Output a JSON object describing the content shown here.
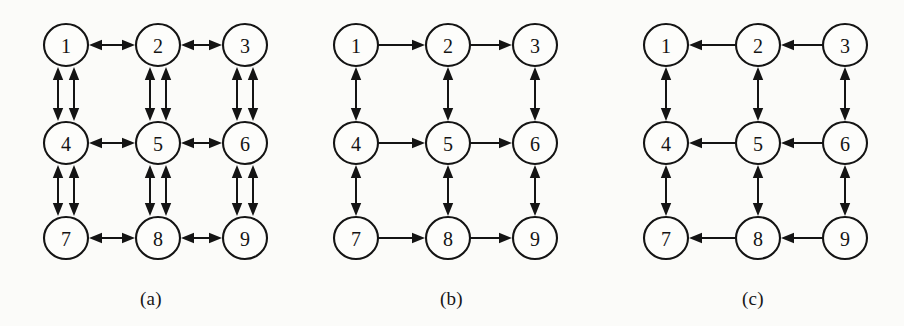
{
  "figure": {
    "background_color": "#fbfbf9",
    "ink_color": "#141414",
    "width": 904,
    "height": 326
  },
  "panels": [
    {
      "id": "a",
      "caption": "(a)",
      "caption_x": 140,
      "caption_y": 288,
      "origin_x": 0,
      "nodes": [
        {
          "id": "n1",
          "label": "1",
          "col": 0,
          "row": 0
        },
        {
          "id": "n2",
          "label": "2",
          "col": 1,
          "row": 0
        },
        {
          "id": "n3",
          "label": "3",
          "col": 2,
          "row": 0
        },
        {
          "id": "n4",
          "label": "4",
          "col": 0,
          "row": 1
        },
        {
          "id": "n5",
          "label": "5",
          "col": 1,
          "row": 1
        },
        {
          "id": "n6",
          "label": "6",
          "col": 2,
          "row": 1
        },
        {
          "id": "n7",
          "label": "7",
          "col": 0,
          "row": 2
        },
        {
          "id": "n8",
          "label": "8",
          "col": 1,
          "row": 2
        },
        {
          "id": "n9",
          "label": "9",
          "col": 2,
          "row": 2
        }
      ],
      "horizontal_edge_style": "bidirectional-single",
      "vertical_edge_style": "bidirectional-double",
      "edges": [
        {
          "from": "1",
          "to": "2",
          "orientation": "horizontal",
          "arrows": "both",
          "lines": 1
        },
        {
          "from": "2",
          "to": "3",
          "orientation": "horizontal",
          "arrows": "both",
          "lines": 1
        },
        {
          "from": "4",
          "to": "5",
          "orientation": "horizontal",
          "arrows": "both",
          "lines": 1
        },
        {
          "from": "5",
          "to": "6",
          "orientation": "horizontal",
          "arrows": "both",
          "lines": 1
        },
        {
          "from": "7",
          "to": "8",
          "orientation": "horizontal",
          "arrows": "both",
          "lines": 1
        },
        {
          "from": "8",
          "to": "9",
          "orientation": "horizontal",
          "arrows": "both",
          "lines": 1
        },
        {
          "from": "1",
          "to": "4",
          "orientation": "vertical",
          "arrows": "both",
          "lines": 2
        },
        {
          "from": "2",
          "to": "5",
          "orientation": "vertical",
          "arrows": "both",
          "lines": 2
        },
        {
          "from": "3",
          "to": "6",
          "orientation": "vertical",
          "arrows": "both",
          "lines": 2
        },
        {
          "from": "4",
          "to": "7",
          "orientation": "vertical",
          "arrows": "both",
          "lines": 2
        },
        {
          "from": "5",
          "to": "8",
          "orientation": "vertical",
          "arrows": "both",
          "lines": 2
        },
        {
          "from": "6",
          "to": "9",
          "orientation": "vertical",
          "arrows": "both",
          "lines": 2
        }
      ]
    },
    {
      "id": "b",
      "caption": "(b)",
      "caption_x": 440,
      "caption_y": 288,
      "origin_x": 290,
      "nodes": [
        {
          "id": "n1",
          "label": "1",
          "col": 0,
          "row": 0
        },
        {
          "id": "n2",
          "label": "2",
          "col": 1,
          "row": 0
        },
        {
          "id": "n3",
          "label": "3",
          "col": 2,
          "row": 0
        },
        {
          "id": "n4",
          "label": "4",
          "col": 0,
          "row": 1
        },
        {
          "id": "n5",
          "label": "5",
          "col": 1,
          "row": 1
        },
        {
          "id": "n6",
          "label": "6",
          "col": 2,
          "row": 1
        },
        {
          "id": "n7",
          "label": "7",
          "col": 0,
          "row": 2
        },
        {
          "id": "n8",
          "label": "8",
          "col": 1,
          "row": 2
        },
        {
          "id": "n9",
          "label": "9",
          "col": 2,
          "row": 2
        }
      ],
      "horizontal_edge_style": "directed-right",
      "vertical_edge_style": "bidirectional-single",
      "edges": [
        {
          "from": "1",
          "to": "2",
          "orientation": "horizontal",
          "arrows": "forward",
          "lines": 1
        },
        {
          "from": "2",
          "to": "3",
          "orientation": "horizontal",
          "arrows": "forward",
          "lines": 1
        },
        {
          "from": "4",
          "to": "5",
          "orientation": "horizontal",
          "arrows": "forward",
          "lines": 1
        },
        {
          "from": "5",
          "to": "6",
          "orientation": "horizontal",
          "arrows": "forward",
          "lines": 1
        },
        {
          "from": "7",
          "to": "8",
          "orientation": "horizontal",
          "arrows": "forward",
          "lines": 1
        },
        {
          "from": "8",
          "to": "9",
          "orientation": "horizontal",
          "arrows": "forward",
          "lines": 1
        },
        {
          "from": "1",
          "to": "4",
          "orientation": "vertical",
          "arrows": "both",
          "lines": 1
        },
        {
          "from": "2",
          "to": "5",
          "orientation": "vertical",
          "arrows": "both",
          "lines": 1
        },
        {
          "from": "3",
          "to": "6",
          "orientation": "vertical",
          "arrows": "both",
          "lines": 1
        },
        {
          "from": "4",
          "to": "7",
          "orientation": "vertical",
          "arrows": "both",
          "lines": 1
        },
        {
          "from": "5",
          "to": "8",
          "orientation": "vertical",
          "arrows": "both",
          "lines": 1
        },
        {
          "from": "6",
          "to": "9",
          "orientation": "vertical",
          "arrows": "both",
          "lines": 1
        }
      ]
    },
    {
      "id": "c",
      "caption": "(c)",
      "caption_x": 742,
      "caption_y": 288,
      "origin_x": 600,
      "nodes": [
        {
          "id": "n1",
          "label": "1",
          "col": 0,
          "row": 0
        },
        {
          "id": "n2",
          "label": "2",
          "col": 1,
          "row": 0
        },
        {
          "id": "n3",
          "label": "3",
          "col": 2,
          "row": 0
        },
        {
          "id": "n4",
          "label": "4",
          "col": 0,
          "row": 1
        },
        {
          "id": "n5",
          "label": "5",
          "col": 1,
          "row": 1
        },
        {
          "id": "n6",
          "label": "6",
          "col": 2,
          "row": 1
        },
        {
          "id": "n7",
          "label": "7",
          "col": 0,
          "row": 2
        },
        {
          "id": "n8",
          "label": "8",
          "col": 1,
          "row": 2
        },
        {
          "id": "n9",
          "label": "9",
          "col": 2,
          "row": 2
        }
      ],
      "horizontal_edge_style": "directed-left",
      "vertical_edge_style": "bidirectional-single",
      "edges": [
        {
          "from": "2",
          "to": "1",
          "orientation": "horizontal",
          "arrows": "backward",
          "lines": 1
        },
        {
          "from": "3",
          "to": "2",
          "orientation": "horizontal",
          "arrows": "backward",
          "lines": 1
        },
        {
          "from": "5",
          "to": "4",
          "orientation": "horizontal",
          "arrows": "backward",
          "lines": 1
        },
        {
          "from": "6",
          "to": "5",
          "orientation": "horizontal",
          "arrows": "backward",
          "lines": 1
        },
        {
          "from": "8",
          "to": "7",
          "orientation": "horizontal",
          "arrows": "backward",
          "lines": 1
        },
        {
          "from": "9",
          "to": "8",
          "orientation": "horizontal",
          "arrows": "backward",
          "lines": 1
        },
        {
          "from": "1",
          "to": "4",
          "orientation": "vertical",
          "arrows": "both",
          "lines": 1
        },
        {
          "from": "2",
          "to": "5",
          "orientation": "vertical",
          "arrows": "both",
          "lines": 1
        },
        {
          "from": "3",
          "to": "6",
          "orientation": "vertical",
          "arrows": "both",
          "lines": 1
        },
        {
          "from": "4",
          "to": "7",
          "orientation": "vertical",
          "arrows": "both",
          "lines": 1
        },
        {
          "from": "5",
          "to": "8",
          "orientation": "vertical",
          "arrows": "both",
          "lines": 1
        },
        {
          "from": "6",
          "to": "9",
          "orientation": "vertical",
          "arrows": "both",
          "lines": 1
        }
      ]
    }
  ],
  "geometry": {
    "col_x": [
      66,
      158,
      245
    ],
    "row_y": [
      45,
      143,
      238
    ],
    "node_rx": 22,
    "node_ry": 21,
    "double_offset": 8
  }
}
